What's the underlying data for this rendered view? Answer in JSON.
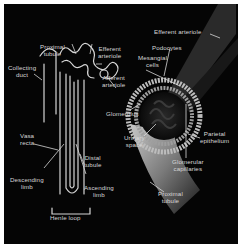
{
  "figure": {
    "colors": {
      "background": "#050505",
      "structure": "#d6d6d6",
      "label_text": "#d8d8d8",
      "margin": "#ffffff"
    },
    "labels": {
      "proximal_tubule_top": [
        "Proximal",
        "tubule"
      ],
      "efferent_arteriole_left": [
        "Efferent",
        "arteriole"
      ],
      "afferent_arteriole": [
        "Afferent",
        "arteriole"
      ],
      "collecting_duct": [
        "Collecting",
        "duct"
      ],
      "glomerulus": [
        "Glomerulus"
      ],
      "vasa_recta": [
        "Vasa",
        "recta"
      ],
      "distal_tubule": [
        "Distal",
        "tubule"
      ],
      "descending_limb": [
        "Descending",
        "limb"
      ],
      "ascending_limb": [
        "Ascending",
        "limb"
      ],
      "henle_loop": [
        "Henle loop"
      ],
      "efferent_arteriole_right": [
        "Efferent arteriole"
      ],
      "podocytes": [
        "Podocytes"
      ],
      "mesangial_cells": [
        "Mesangial",
        "cells"
      ],
      "urinary_space": [
        "Urinary",
        "space"
      ],
      "parietal_epithelium": [
        "Parietal",
        "epithelium"
      ],
      "glomerular_capillaries": [
        "Glomerular",
        "capillaries"
      ],
      "proximal_tubule_bottom": [
        "Proximal",
        "tubule"
      ]
    }
  }
}
